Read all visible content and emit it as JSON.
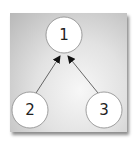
{
  "diagram": {
    "nodes": [
      {
        "id": "1",
        "label": "1",
        "cx": 64,
        "cy": 35
      },
      {
        "id": "2",
        "label": "2",
        "cx": 30,
        "cy": 110
      },
      {
        "id": "3",
        "label": "3",
        "cx": 104,
        "cy": 110
      }
    ],
    "edges": [
      {
        "from": "2",
        "to": "1"
      },
      {
        "from": "3",
        "to": "1"
      }
    ],
    "colors": {
      "node_fill": "#ffffff",
      "node_stroke": "#888888",
      "edge": "#444444"
    }
  }
}
